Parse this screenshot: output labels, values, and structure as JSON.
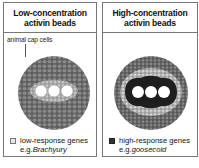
{
  "panels": [
    {
      "id": "low",
      "title_line1": "Low-concentration",
      "title_line2": "activin beads",
      "annotation": "animal cap cells",
      "legend": {
        "swatch_color": "#e8e8e8",
        "label": "low-response genes",
        "example_prefix": "e.g.",
        "example_gene": "Brachyury"
      }
    },
    {
      "id": "high",
      "title_line1": "High-concentration",
      "title_line2": "activin beads",
      "legend": {
        "swatch_color": "#333333",
        "label": "high-response genes",
        "example_prefix": "e.g.",
        "example_gene": "goosecoid"
      }
    }
  ],
  "beads_per_panel": 3,
  "colors": {
    "border": "#777777",
    "cell_mass": "#6a6a6a",
    "high_response_region": "#1e1e1e",
    "bead": "#ffffff"
  }
}
